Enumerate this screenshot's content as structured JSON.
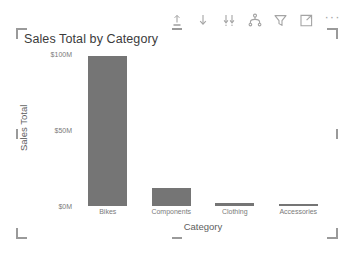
{
  "toolbar": {
    "buttons": [
      {
        "name": "drill-up-icon",
        "tooltip": "Drill up"
      },
      {
        "name": "drill-down-arrow-icon",
        "tooltip": "Drill down"
      },
      {
        "name": "expand-next-level-icon",
        "tooltip": "Go to the next level in the hierarchy"
      },
      {
        "name": "drill-mode-icon",
        "tooltip": "Expand all down one level in the hierarchy"
      },
      {
        "name": "filter-funnel-icon",
        "tooltip": "Filters"
      },
      {
        "name": "focus-mode-icon",
        "tooltip": "Focus mode"
      }
    ],
    "more_options_label": "···",
    "more_options_name": "more-options-icon"
  },
  "visual": {
    "title": "Sales Total by Category"
  },
  "chart_data": {
    "type": "bar",
    "title": "Sales Total by Category",
    "xlabel": "Category",
    "ylabel": "Sales Total",
    "categories": [
      "Bikes",
      "Components",
      "Clothing",
      "Accessories"
    ],
    "values": [
      99,
      12,
      2,
      1
    ],
    "value_unit": "$M",
    "ylim": [
      0,
      100
    ],
    "yticks": [
      "$0M",
      "$50M",
      "$100M"
    ],
    "ytick_values": [
      0,
      50,
      100
    ],
    "grid": false,
    "legend": "none",
    "series_color": "#757575"
  },
  "colors": {
    "bar": "#757575",
    "axis_text": "#7a7a7a",
    "axis_title": "#5e5e5e",
    "title_text": "#3b3b3b",
    "selection_handle": "#9a9a9a",
    "background": "#ffffff"
  }
}
